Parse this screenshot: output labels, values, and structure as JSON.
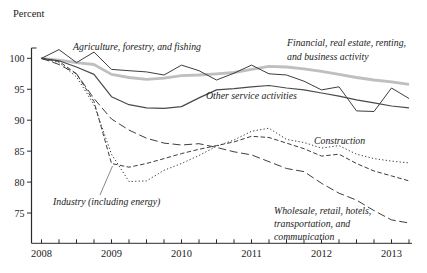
{
  "chart_data": {
    "type": "line",
    "unit_label": "Percent",
    "x_axis": {
      "frequency": "quarterly",
      "start": "2008-Q1",
      "end": "2013-Q2",
      "tick_labels": [
        "2008",
        "2009",
        "2010",
        "2011",
        "2012",
        "2013"
      ]
    },
    "y_axis": {
      "ticks": [
        100,
        95,
        90,
        85,
        80,
        75
      ],
      "min": 73,
      "max": 102
    },
    "grid": false,
    "legend_position": "inline-annotations",
    "series": [
      {
        "key": "financial",
        "name": "Financial, real estate, renting, and business activity",
        "color": "#bfbfbf",
        "stroke_width": 2.8,
        "dash": "",
        "values": [
          100,
          99.7,
          99.3,
          99.0,
          97.4,
          96.9,
          96.6,
          96.8,
          97.2,
          97.3,
          97.5,
          97.7,
          98.2,
          98.7,
          98.6,
          98.3,
          97.9,
          97.4,
          96.9,
          96.5,
          96.2,
          95.8
        ]
      },
      {
        "key": "agriculture",
        "name": "Agriculture, forestry, and fishing",
        "color": "#3e3e3e",
        "stroke_width": 1,
        "dash": "",
        "values": [
          100,
          101.4,
          99.3,
          101.0,
          98.2,
          98.0,
          97.8,
          97.3,
          98.9,
          98.0,
          96.5,
          97.6,
          98.9,
          97.5,
          97.3,
          96.3,
          94.9,
          95.4,
          91.5,
          91.4,
          95.2,
          93.5
        ]
      },
      {
        "key": "other_services",
        "name": "Other service activities",
        "color": "#4a4a4a",
        "stroke_width": 1.2,
        "dash": "",
        "values": [
          100,
          99.6,
          98.6,
          97.4,
          93.8,
          92.5,
          92.0,
          91.9,
          92.2,
          93.6,
          94.9,
          95.1,
          95.4,
          95.6,
          95.2,
          94.9,
          94.4,
          93.9,
          93.3,
          92.8,
          92.3,
          92.0
        ]
      },
      {
        "key": "construction",
        "name": "Construction",
        "color": "#3e3e3e",
        "stroke_width": 1,
        "dash": "1.3 2.2",
        "values": [
          100,
          99.3,
          97.0,
          92.5,
          84.5,
          80.1,
          80.2,
          81.9,
          83.0,
          84.3,
          85.8,
          86.8,
          88.2,
          88.7,
          86.9,
          86.4,
          85.5,
          85.9,
          84.5,
          83.8,
          83.4,
          83.1
        ]
      },
      {
        "key": "industry",
        "name": "Industry (including energy)",
        "color": "#3e3e3e",
        "stroke_width": 1,
        "dash": "4.5 2.4",
        "values": [
          100,
          99.5,
          97.5,
          93.0,
          83.0,
          82.4,
          83.0,
          83.8,
          84.6,
          85.3,
          85.9,
          86.5,
          87.4,
          87.2,
          86.3,
          85.4,
          84.2,
          84.5,
          83.0,
          81.8,
          81.0,
          80.2
        ]
      },
      {
        "key": "wholesale",
        "name": "Wholesale, retail, hotels, transportation, and communication",
        "color": "#3e3e3e",
        "stroke_width": 1,
        "dash": "8 3.6",
        "values": [
          100,
          99.0,
          97.5,
          93.5,
          90.2,
          88.4,
          87.1,
          86.3,
          86.0,
          86.2,
          85.6,
          84.9,
          84.4,
          83.3,
          82.2,
          81.7,
          79.8,
          78.2,
          77.1,
          75.4,
          73.9,
          73.4
        ]
      }
    ]
  },
  "annotation_labels": {
    "agriculture": {
      "lines": [
        "Agriculture, forestry, and fishing"
      ]
    },
    "financial": {
      "lines": [
        "Financial, real estate, renting,",
        "and business activity"
      ]
    },
    "other_services": {
      "lines": [
        "Other service activities"
      ]
    },
    "construction": {
      "lines": [
        "Construction"
      ]
    },
    "industry": {
      "lines": [
        "Industry (including energy)"
      ]
    },
    "wholesale": {
      "lines": [
        "Wholesale, retail, hotels,",
        "transportation, and",
        "communication"
      ]
    }
  },
  "axis_color": "#2b2b2b"
}
